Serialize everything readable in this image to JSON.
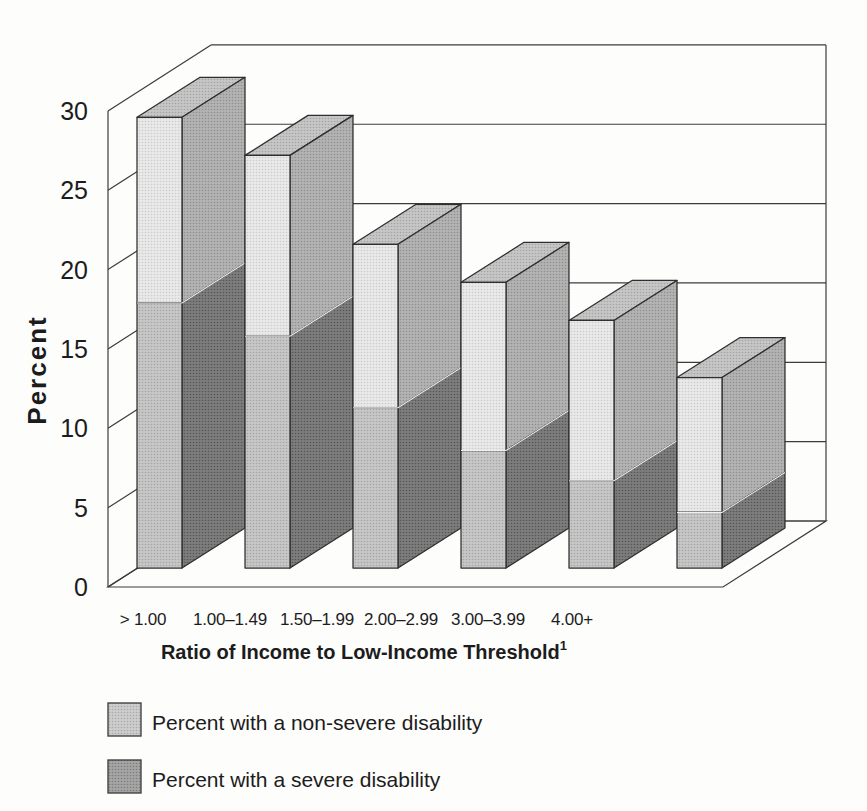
{
  "figure": {
    "background": "#fdfdfc"
  },
  "chart_data": {
    "type": "bar",
    "variant": "3d-stacked-column",
    "title": "",
    "xlabel": "Ratio of Income to Low-Income Threshold",
    "xlabel_footnote_mark": "1",
    "ylabel": "Percent",
    "ylim": [
      0,
      30
    ],
    "yticks": [
      0,
      5,
      10,
      15,
      20,
      25,
      30
    ],
    "grid": "3d-walls",
    "legend_position": "below-left",
    "categories": [
      "> 1.00",
      "1.00–1.49",
      "1.50–1.99",
      "2.00–2.99",
      "3.00–3.99",
      "4.00+"
    ],
    "series": [
      {
        "name": "Percent with a severe disability",
        "stack_position": "bottom",
        "values": [
          16.7,
          14.6,
          10.1,
          7.4,
          5.5,
          3.5
        ]
      },
      {
        "name": "Percent with a non-severe disability",
        "stack_position": "top",
        "values": [
          11.7,
          11.4,
          10.3,
          10.6,
          10.1,
          8.5
        ]
      }
    ],
    "stacked_totals": [
      28.4,
      26.0,
      20.4,
      18.0,
      15.6,
      12.0
    ]
  },
  "legend": {
    "items": [
      {
        "label": "Percent with a non-severe disability",
        "series_index": 1,
        "color_key": "legend_non_severe"
      },
      {
        "label": "Percent with a severe disability",
        "series_index": 0,
        "color_key": "legend_severe"
      }
    ]
  },
  "colors": {
    "non_severe_front": {
      "base": "#e9e9e9",
      "dot": "#cccccc"
    },
    "non_severe_side": {
      "base": "#b3b3b3",
      "dot": "#8f8f8f"
    },
    "severe_front": {
      "base": "#c7c7c7",
      "dot": "#a5a5a5"
    },
    "severe_side": {
      "base": "#7d7d7d",
      "dot": "#555555"
    },
    "bar_top": {
      "base": "#c6c6c6",
      "dot": "#a4a4a4"
    },
    "legend_non_severe": {
      "base": "#cdcdcd",
      "dot": "#a9a9a9"
    },
    "legend_severe": {
      "base": "#a5a5a5",
      "dot": "#7d7d7d"
    },
    "outline": "#2f2f2f",
    "wall_line": "#3c3c3c",
    "segment_divider": "#efefef",
    "text": "#1c1c1c"
  }
}
